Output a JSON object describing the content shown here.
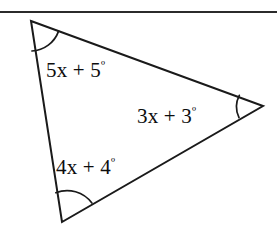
{
  "figure": {
    "type": "geometry-diagram",
    "shape": "triangle",
    "background_color": "#ffffff",
    "stroke_color": "#1a1a1a",
    "top_rule": {
      "present": true,
      "color": "#2b2b2b",
      "y": 12
    },
    "vertices": [
      {
        "name": "top-left-vertex",
        "x": 31,
        "y": 21
      },
      {
        "name": "right-vertex",
        "x": 263,
        "y": 106
      },
      {
        "name": "bottom-left-vertex",
        "x": 62,
        "y": 222
      }
    ],
    "edges": [
      {
        "name": "edge-top",
        "from": "top-left-vertex",
        "to": "right-vertex"
      },
      {
        "name": "edge-right",
        "from": "right-vertex",
        "to": "bottom-left-vertex"
      },
      {
        "name": "edge-left",
        "from": "bottom-left-vertex",
        "to": "top-left-vertex"
      }
    ],
    "angle_marks": [
      {
        "name": "angle-arc-top-left",
        "at": "top-left-vertex"
      },
      {
        "name": "angle-arc-right",
        "at": "right-vertex"
      },
      {
        "name": "angle-arc-bottom-left",
        "at": "bottom-left-vertex"
      }
    ],
    "labels": {
      "top_left": {
        "expression": "5x + 5",
        "degree_symbol": "º",
        "full_text": "5x + 5º"
      },
      "right": {
        "expression": "3x + 3",
        "degree_symbol": "º",
        "full_text": "3x + 3º"
      },
      "bottom_left": {
        "expression": "4x + 4",
        "degree_symbol": "º",
        "full_text": "4x + 4º"
      }
    }
  }
}
